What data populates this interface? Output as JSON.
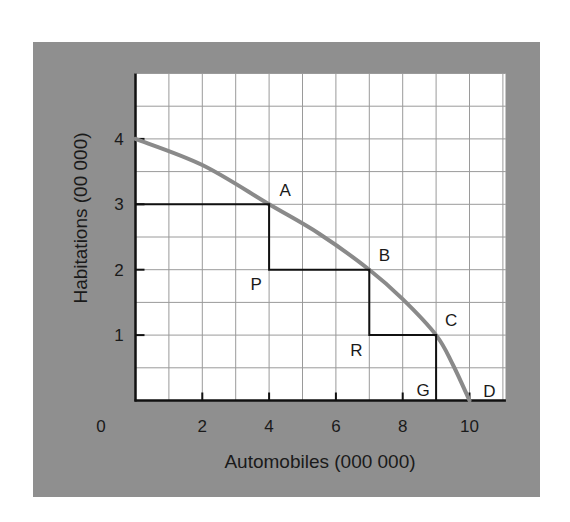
{
  "chart_data": {
    "type": "line",
    "title": "",
    "xlabel": "Automobiles (000 000)",
    "ylabel": "Habitations (00 000)",
    "xlim": [
      0,
      11
    ],
    "ylim": [
      0,
      5
    ],
    "origin_label": "0",
    "x_ticks": [
      2,
      4,
      6,
      8,
      10
    ],
    "x_tick_labels": [
      "2",
      "4",
      "6",
      "8",
      "10"
    ],
    "y_ticks": [
      1,
      2,
      3,
      4
    ],
    "y_tick_labels": [
      "1",
      "2",
      "3",
      "4"
    ],
    "grid": true,
    "grid_step_x": 1,
    "grid_step_y": 0.5,
    "legend": null,
    "series": [
      {
        "name": "Production possibility frontier",
        "style": "curve",
        "color": "#8a8a8a",
        "x": [
          0,
          2,
          4,
          5.5,
          7,
          8,
          9,
          9.5,
          10
        ],
        "y": [
          4,
          3.6,
          3,
          2.55,
          2,
          1.55,
          1,
          0.55,
          0
        ]
      },
      {
        "name": "Staircase",
        "style": "step",
        "color": "#111111",
        "x": [
          0,
          4,
          4,
          7,
          7,
          9,
          9
        ],
        "y": [
          3,
          3,
          2,
          2,
          1,
          1,
          0
        ]
      }
    ],
    "points": [
      {
        "label": "A",
        "x": 4,
        "y": 3,
        "on_curve": true
      },
      {
        "label": "B",
        "x": 7,
        "y": 2,
        "on_curve": true
      },
      {
        "label": "C",
        "x": 9,
        "y": 1,
        "on_curve": true
      },
      {
        "label": "D",
        "x": 10,
        "y": 0,
        "on_curve": true
      },
      {
        "label": "P",
        "x": 4,
        "y": 2,
        "on_curve": false
      },
      {
        "label": "R",
        "x": 7,
        "y": 1,
        "on_curve": false
      },
      {
        "label": "G",
        "x": 9,
        "y": 0,
        "on_curve": false
      }
    ],
    "colors": {
      "frame_background": "#8f8f8f",
      "plot_background": "#ffffff",
      "grid": "#9a9a9a",
      "axis": "#111111",
      "curve": "#8a8a8a",
      "steps": "#111111"
    }
  }
}
